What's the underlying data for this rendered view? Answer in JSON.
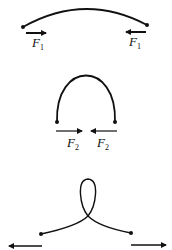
{
  "diagram": {
    "panels": [
      {
        "name": "shallow-arc",
        "forces": [
          {
            "label": "F",
            "subscript": "1",
            "direction": "right"
          },
          {
            "label": "F",
            "subscript": "1",
            "direction": "left"
          }
        ]
      },
      {
        "name": "tall-arch",
        "forces": [
          {
            "label": "F",
            "subscript": "2",
            "direction": "right"
          },
          {
            "label": "F",
            "subscript": "2",
            "direction": "left"
          }
        ]
      },
      {
        "name": "loop",
        "forces": [
          {
            "label": "",
            "subscript": "",
            "direction": "left"
          },
          {
            "label": "",
            "subscript": "",
            "direction": "right"
          }
        ]
      }
    ],
    "colors": {
      "stroke": "#111111",
      "background": "#ffffff"
    }
  }
}
